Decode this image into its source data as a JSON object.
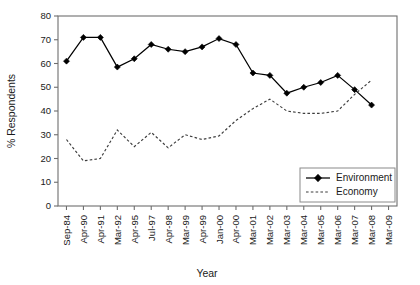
{
  "chart_data": {
    "type": "line",
    "title": "",
    "xlabel": "Year",
    "ylabel": "% Respondents",
    "ylim": [
      0,
      80
    ],
    "yticks": [
      0,
      10,
      20,
      30,
      40,
      50,
      60,
      70,
      80
    ],
    "grid": false,
    "legend_position": "lower-right-inside",
    "categories": [
      "Sep-84",
      "Apr-90",
      "Apr-91",
      "Mar-92",
      "Apr-95",
      "Jul-97",
      "Apr-98",
      "Mar-99",
      "Apr-99",
      "Jan-00",
      "Apr-00",
      "Mar-01",
      "Mar-02",
      "Mar-03",
      "Mar-04",
      "Mar-05",
      "Mar-06",
      "Mar-07",
      "Mar-08",
      "Mar-09"
    ],
    "series": [
      {
        "name": "Environment",
        "marker": "diamond",
        "linestyle": "solid",
        "color": "#000000",
        "values": [
          61,
          71,
          71,
          58.5,
          62,
          68,
          66,
          65,
          67,
          70.5,
          68,
          56,
          55,
          47.5,
          50,
          52,
          55,
          49,
          42.5,
          null
        ]
      },
      {
        "name": "Economy",
        "marker": "none",
        "linestyle": "dashed",
        "color": "#3d3d3d",
        "values": [
          28,
          19,
          20,
          32,
          25,
          31,
          24.5,
          30,
          28,
          29.5,
          36,
          41,
          45,
          40,
          39,
          39,
          40,
          47,
          53,
          null
        ]
      }
    ]
  },
  "legend": {
    "entries": [
      {
        "label": "Environment",
        "style": "solid-diamond"
      },
      {
        "label": "Economy",
        "style": "dashed"
      }
    ]
  },
  "axes": {
    "y_title": "% Respondents",
    "x_title": "Year"
  }
}
